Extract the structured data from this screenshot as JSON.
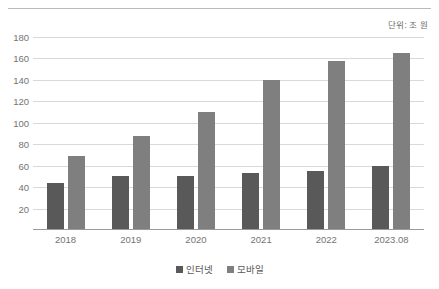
{
  "unit_note": "단위: 조 원",
  "chart_data": {
    "type": "bar",
    "title": "",
    "subtitle": "",
    "xlabel": "",
    "ylabel": "",
    "annotation": "단위: 조 원",
    "categories": [
      "2018",
      "2019",
      "2020",
      "2021",
      "2022",
      "2023.08"
    ],
    "series": [
      {
        "name": "인터넷",
        "color": "#595959",
        "values": [
          44,
          50,
          50,
          53,
          55,
          60
        ]
      },
      {
        "name": "모바일",
        "color": "#7f7f7f",
        "values": [
          69,
          88,
          110,
          140,
          158,
          165
        ]
      }
    ],
    "ylim": [
      0,
      180
    ],
    "ytick_step": 20,
    "yticks": [
      180,
      160,
      140,
      120,
      100,
      80,
      60,
      40,
      20
    ],
    "grid": "horizontal",
    "legend_position": "bottom",
    "legend": [
      "인터넷",
      "모바일"
    ]
  }
}
